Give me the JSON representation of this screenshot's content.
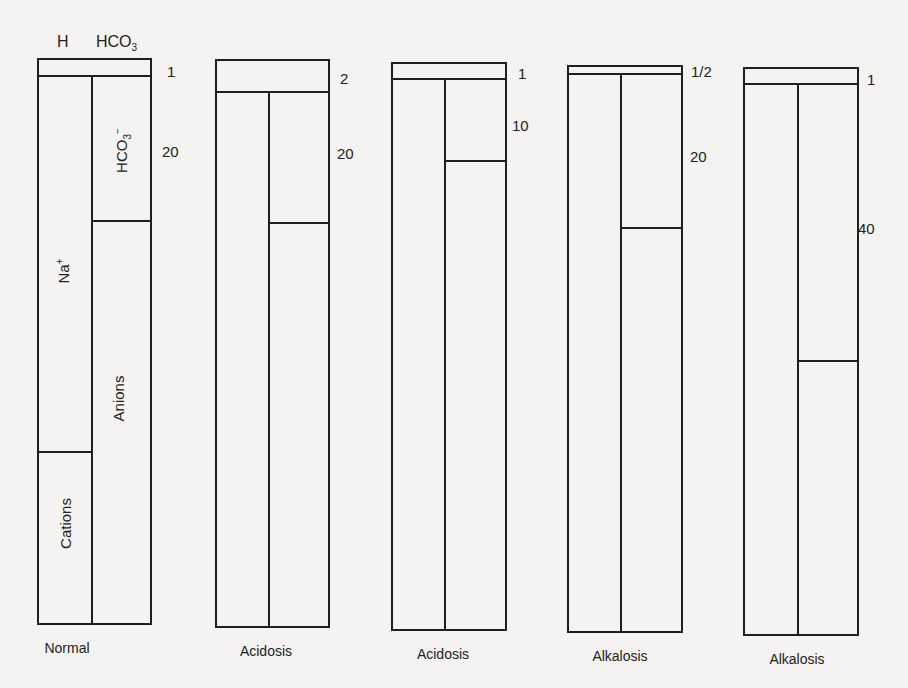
{
  "header": {
    "h_label": "H",
    "hco3_label": "HCO",
    "hco3_sub": "3"
  },
  "inner_labels": {
    "na": "Na",
    "na_sup": "+",
    "hco3": "HCO",
    "hco3_sub": "3",
    "hco3_sup": "−",
    "anions": "Anions",
    "cations": "Cations"
  },
  "columns": [
    {
      "caption": "Normal",
      "ratio_top": "1",
      "ratio_hco3": "20"
    },
    {
      "caption": "Acidosis",
      "ratio_top": "2",
      "ratio_hco3": "20"
    },
    {
      "caption": "Acidosis",
      "ratio_top": "1",
      "ratio_hco3": "10"
    },
    {
      "caption": "Alkalosis",
      "ratio_top": "1/2",
      "ratio_hco3": "20"
    },
    {
      "caption": "Alkalosis",
      "ratio_top": "1",
      "ratio_hco3": "40"
    }
  ],
  "colors": {
    "background": "#f4f3f1",
    "line": "#1e1e1e"
  }
}
